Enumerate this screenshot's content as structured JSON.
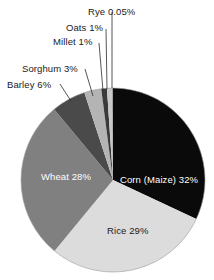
{
  "chart_data": {
    "type": "pie",
    "title": "",
    "subtitle": "",
    "xlabel": "",
    "ylabel": "",
    "legend_position": "none",
    "grid": false,
    "labels_inside": [
      "Corn (Maize)",
      "Rice",
      "Wheat"
    ],
    "labels_callout": [
      "Barley",
      "Sorghum",
      "Millet",
      "Oats",
      "Rye"
    ],
    "categories": [
      "Corn (Maize)",
      "Rice",
      "Wheat",
      "Barley",
      "Sorghum",
      "Millet",
      "Oats",
      "Rye"
    ],
    "values": [
      32,
      29,
      28,
      6,
      3,
      1,
      1,
      0.05
    ],
    "value_labels": [
      "32%",
      "29%",
      "28%",
      "6%",
      "3%",
      "1%",
      "1%",
      "0.05%"
    ],
    "full_labels": [
      "Corn (Maize) 32%",
      "Rice 29%",
      "Wheat 28%",
      "Barley 6%",
      "Sorghum 3%",
      "Millet 1%",
      "Oats 1%",
      "Rye 0.05%"
    ],
    "colors": [
      "#0a0a0a",
      "#dcdcdc",
      "#808080",
      "#4a4a4a",
      "#b4b4b4",
      "#3a3a3a",
      "#c8c8c8",
      "#151515"
    ],
    "start_angle_deg": 0,
    "direction": "clockwise",
    "center": {
      "x": 113,
      "y": 180
    },
    "radius": 92
  },
  "pie": {
    "slices": [
      {
        "name": "corn",
        "label": "Corn (Maize) 32%",
        "value": 32,
        "color": "#0a0a0a",
        "text_color": "light"
      },
      {
        "name": "rice",
        "label": "Rice 29%",
        "value": 29,
        "color": "#dcdcdc",
        "text_color": "dark"
      },
      {
        "name": "wheat",
        "label": "Wheat 28%",
        "value": 28,
        "color": "#808080",
        "text_color": "light"
      },
      {
        "name": "barley",
        "label": "Barley 6%",
        "value": 6,
        "color": "#4a4a4a",
        "text_color": "dark"
      },
      {
        "name": "sorghum",
        "label": "Sorghum 3%",
        "value": 3,
        "color": "#b4b4b4",
        "text_color": "dark"
      },
      {
        "name": "millet",
        "label": "Millet 1%",
        "value": 1,
        "color": "#3a3a3a",
        "text_color": "dark"
      },
      {
        "name": "oats",
        "label": "Oats 1%",
        "value": 1,
        "color": "#c8c8c8",
        "text_color": "dark"
      },
      {
        "name": "rye",
        "label": "Rye 0.05%",
        "value": 0.05,
        "color": "#151515",
        "text_color": "dark"
      }
    ],
    "inside_labels": {
      "corn": "Corn (Maize) 32%",
      "rice": "Rice 29%",
      "wheat": "Wheat 28%"
    },
    "callout_labels": {
      "barley": "Barley 6%",
      "sorghum": "Sorghum 3%",
      "millet": "Millet 1%",
      "oats": "Oats 1%",
      "rye": "Rye 0.05%"
    }
  }
}
